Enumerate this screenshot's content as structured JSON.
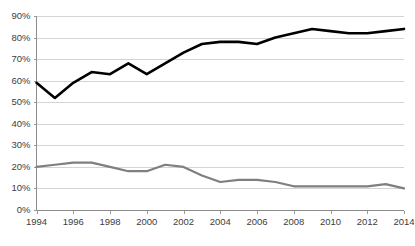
{
  "chart_data": {
    "type": "line",
    "title": "",
    "subtitle": "",
    "xlabel": "",
    "ylabel": "",
    "x": [
      1994,
      1995,
      1996,
      1997,
      1998,
      1999,
      2000,
      2001,
      2002,
      2003,
      2004,
      2005,
      2006,
      2007,
      2008,
      2009,
      2010,
      2011,
      2012,
      2013,
      2014
    ],
    "xlim": [
      1994,
      2014
    ],
    "ylim": [
      0,
      90
    ],
    "y_tick_labels": [
      "0%",
      "10%",
      "20%",
      "30%",
      "40%",
      "50%",
      "60%",
      "70%",
      "80%",
      "90%"
    ],
    "y_tick_values": [
      0,
      10,
      20,
      30,
      40,
      50,
      60,
      70,
      80,
      90
    ],
    "x_tick_labels": [
      "1994",
      "1996",
      "1998",
      "2000",
      "2002",
      "2004",
      "2006",
      "2008",
      "2010",
      "2012",
      "2014"
    ],
    "x_tick_values": [
      1994,
      1996,
      1998,
      2000,
      2002,
      2004,
      2006,
      2008,
      2010,
      2012,
      2014
    ],
    "grid": "horizontal",
    "legend": "none",
    "series": [
      {
        "name": "upper-series",
        "color": "#000000",
        "stroke_width": 2.6,
        "values": [
          59,
          52,
          59,
          64,
          63,
          68,
          63,
          68,
          73,
          77,
          78,
          78,
          77,
          80,
          82,
          84,
          83,
          82,
          82,
          83,
          84
        ]
      },
      {
        "name": "lower-series",
        "color": "#7f7f7f",
        "stroke_width": 2.2,
        "values": [
          20,
          21,
          22,
          22,
          20,
          18,
          18,
          21,
          20,
          16,
          13,
          14,
          14,
          13,
          11,
          11,
          11,
          11,
          11,
          12,
          10
        ]
      }
    ]
  }
}
